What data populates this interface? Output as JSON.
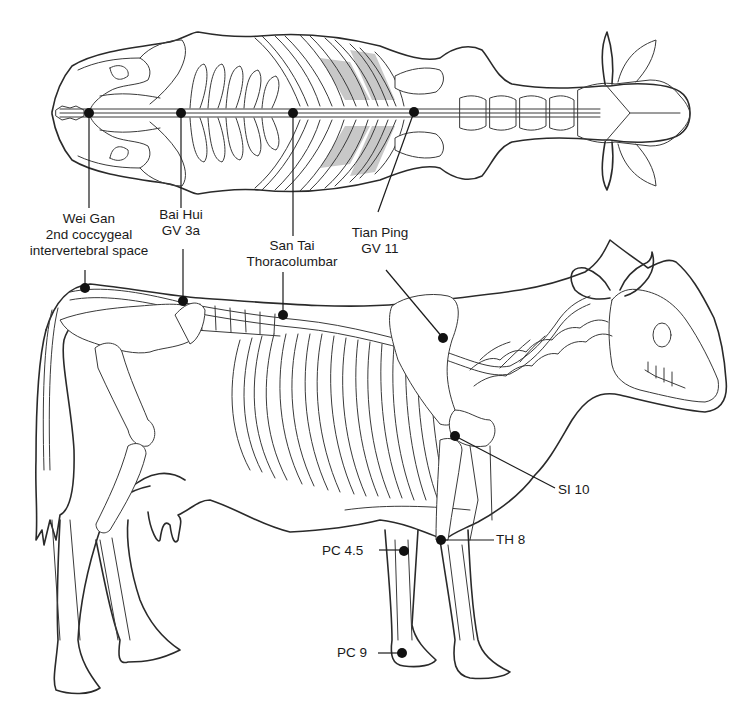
{
  "figure": {
    "views": [
      "dorsal-view",
      "lateral-view"
    ]
  },
  "labels": {
    "wei_gan": {
      "name": "Wei Gan",
      "line2": "2nd coccygeal",
      "line3": "intervertebral space"
    },
    "bai_hui": {
      "name": "Bai Hui",
      "code": "GV 3a"
    },
    "san_tai": {
      "name": "San Tai",
      "line2": "Thoracolumbar"
    },
    "tian_ping": {
      "name": "Tian Ping",
      "code": "GV 11"
    },
    "si10": {
      "code": "SI 10"
    },
    "th8": {
      "code": "TH 8"
    },
    "pc45": {
      "code": "PC 4.5"
    },
    "pc9": {
      "code": "PC 9"
    }
  },
  "points": {
    "dorsal": [
      {
        "id": "wei_gan",
        "x": 89,
        "y": 113
      },
      {
        "id": "bai_hui",
        "x": 181,
        "y": 113
      },
      {
        "id": "san_tai",
        "x": 293,
        "y": 113
      },
      {
        "id": "tian_ping",
        "x": 414,
        "y": 112
      }
    ],
    "lateral": [
      {
        "id": "wei_gan",
        "x": 85,
        "y": 288
      },
      {
        "id": "bai_hui",
        "x": 183,
        "y": 301
      },
      {
        "id": "san_tai",
        "x": 283,
        "y": 315
      },
      {
        "id": "tian_ping",
        "x": 443,
        "y": 338
      },
      {
        "id": "si10",
        "x": 455,
        "y": 436
      },
      {
        "id": "th8",
        "x": 441,
        "y": 540
      },
      {
        "id": "pc45",
        "x": 404,
        "y": 551
      },
      {
        "id": "pc9",
        "x": 402,
        "y": 653
      }
    ]
  },
  "colors": {
    "line": "#2a2a2a",
    "dot": "#111111",
    "background": "#ffffff",
    "rib_shade": "#9a9a9a"
  }
}
